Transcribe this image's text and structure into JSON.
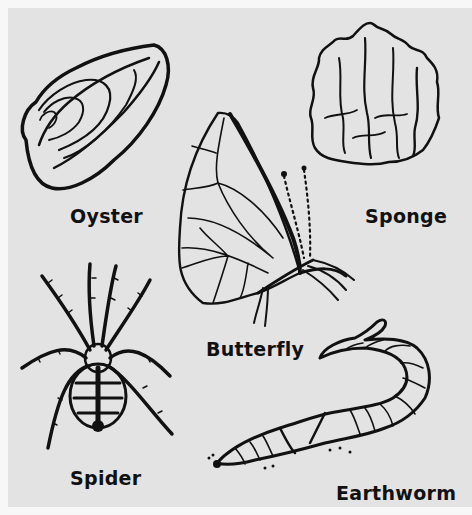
{
  "figure": {
    "background_color": "#e3e3e3",
    "ink_color": "#111111",
    "organisms": [
      {
        "id": "oyster",
        "label": "Oyster"
      },
      {
        "id": "sponge",
        "label": "Sponge"
      },
      {
        "id": "butterfly",
        "label": "Butterfly"
      },
      {
        "id": "spider",
        "label": "Spider"
      },
      {
        "id": "earthworm",
        "label": "Earthworm"
      }
    ]
  }
}
